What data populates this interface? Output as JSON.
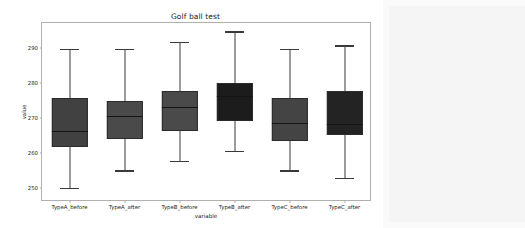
{
  "figure": {
    "title": "Golf ball test",
    "background_color": "#ffffff",
    "surround_color": "#f5f5f5"
  },
  "chart_data": {
    "type": "box",
    "title": "Golf ball test",
    "xlabel": "variable",
    "ylabel": "value",
    "ylim": [
      246,
      297
    ],
    "yticks": [
      250,
      260,
      270,
      280,
      290
    ],
    "ytick_labels": [
      "250",
      "260",
      "270",
      "280",
      "290"
    ],
    "grid": false,
    "legend": null,
    "categories": [
      "TypeA_before",
      "TypeA_after",
      "TypeB_before",
      "TypeB_after",
      "TypeC_before",
      "TypeC_after"
    ],
    "box_color": "#3f3f3f",
    "boxes": [
      {
        "category": "TypeA_before",
        "whisker_low": 250.0,
        "q1": 261.7,
        "median": 266.3,
        "q3": 275.7,
        "whisker_high": 289.7,
        "fill": "#414141"
      },
      {
        "category": "TypeA_after",
        "whisker_low": 255.0,
        "q1": 263.9,
        "median": 270.6,
        "q3": 274.9,
        "whisker_high": 289.7,
        "fill": "#4a4a4a"
      },
      {
        "category": "TypeB_before",
        "whisker_low": 257.7,
        "q1": 266.3,
        "median": 273.1,
        "q3": 277.7,
        "whisker_high": 291.7,
        "fill": "#4a4a4a"
      },
      {
        "category": "TypeB_after",
        "whisker_low": 260.6,
        "q1": 269.1,
        "median": 276.3,
        "q3": 280.0,
        "whisker_high": 294.6,
        "fill": "#1c1c1c"
      },
      {
        "category": "TypeC_before",
        "whisker_low": 255.0,
        "q1": 263.4,
        "median": 268.6,
        "q3": 275.7,
        "whisker_high": 289.7,
        "fill": "#444444"
      },
      {
        "category": "TypeC_after",
        "whisker_low": 252.9,
        "q1": 265.1,
        "median": 268.3,
        "q3": 277.7,
        "whisker_high": 290.6,
        "fill": "#232323"
      }
    ]
  }
}
